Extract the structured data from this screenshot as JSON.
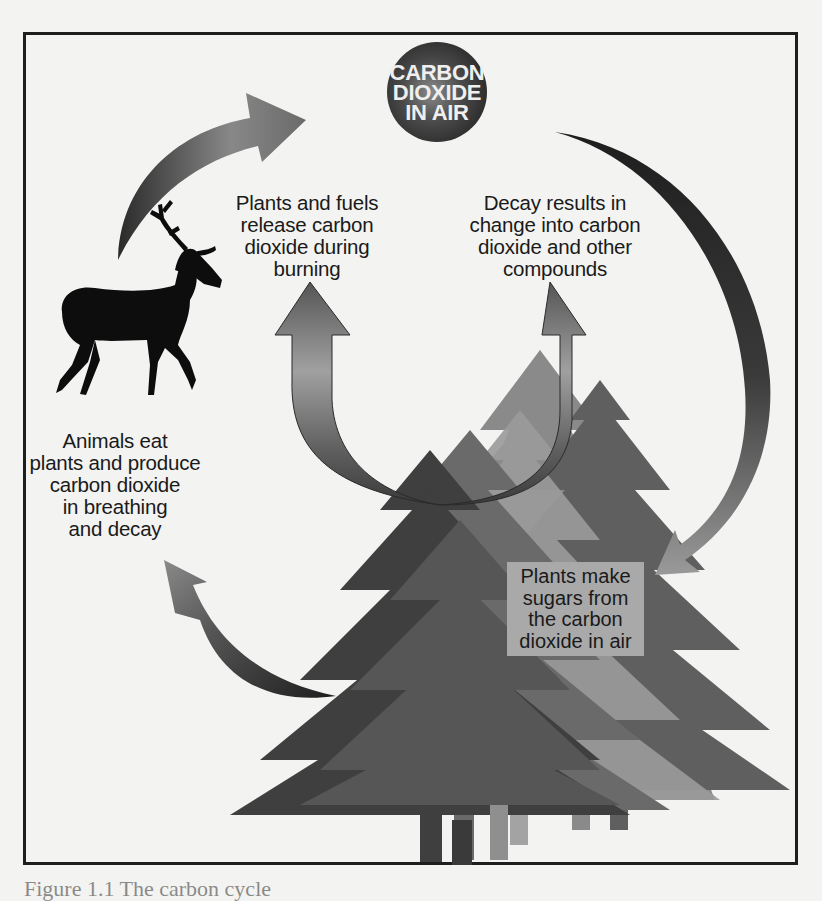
{
  "diagram": {
    "title": "Carbon cycle",
    "center_node": {
      "lines": [
        "CARBON",
        "DIOXIDE",
        "IN AIR"
      ],
      "color": "#3a3a3a"
    },
    "labels": {
      "plants_fuels": [
        "Plants and fuels",
        "release carbon",
        "dioxide during",
        "burning"
      ],
      "decay": [
        "Decay results in",
        "change into carbon",
        "dioxide and other",
        "compounds"
      ],
      "animals": [
        "Animals eat",
        "plants and produce",
        "carbon dioxide",
        "in breathing",
        "and decay"
      ],
      "plants_sugar": [
        "Plants make",
        "sugars from",
        "the carbon",
        "dioxide in air"
      ]
    },
    "icons": {
      "animal": "deer-silhouette",
      "plants": "pine-trees",
      "arrows": [
        "animal-to-air-arrow",
        "air-to-plants-arrow",
        "plants-to-animal-arrow",
        "burning-up-arrow",
        "decay-up-arrow"
      ]
    },
    "colors": {
      "border": "#1e1e1e",
      "background": "#f3f3f1",
      "tree_dark": "#3b3b3b",
      "tree_mid": "#5a5a5a",
      "tree_light": "#858585",
      "arrow_dark": "#2a2a2a",
      "arrow_light": "#9a9a9a"
    }
  },
  "caption": {
    "text": "Figure 1.1  The carbon cycle"
  }
}
